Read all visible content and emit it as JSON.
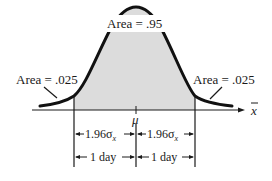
{
  "diagram": {
    "type": "normal-distribution-confidence-interval",
    "colors": {
      "curve": "#111111",
      "fill": "#dcdcdc",
      "line": "#1a1a1a",
      "background": "#ffffff"
    },
    "labels": {
      "center_area": "Area = .95",
      "left_tail": "Area = .025",
      "right_tail": "Area = .025",
      "mean": "μ",
      "axis": "x",
      "half_width_left": "1.96σ",
      "half_width_right": "1.96σ",
      "sigma_subscript": "x",
      "day_left": "1 day",
      "day_right": "1 day"
    }
  }
}
